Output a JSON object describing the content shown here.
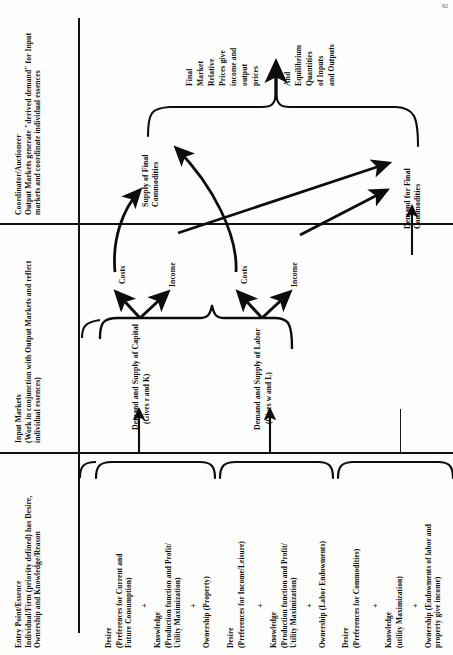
{
  "diagram": {
    "page_number": "92"
  },
  "sections": [
    {
      "id": "coordinator",
      "heading": "Coordinator/Auctioneer",
      "body": "Output Markets generate \"derived demand\" for Input markets and coordinate individual essences"
    },
    {
      "id": "input-markets",
      "heading": "Input Markets",
      "body": "(Work in conjunction with Output Markets and reflect individual essences)"
    },
    {
      "id": "entry-point",
      "heading": "Entry Point/Essence",
      "body": "Individual/Firm (priority defined) has Desire, Ownership and Knowledge/Reason"
    }
  ],
  "output_nodes": {
    "supply": "Supply of Final Commodities",
    "demand": "Demand for Final Commodities"
  },
  "outcome": {
    "line1": "Final",
    "line2": "Market",
    "line3": "Relative",
    "line4": "Prices give",
    "line5": "income and",
    "line6": "output",
    "line7": "prices",
    "line8": "And",
    "line9": "Equilibrium",
    "line10": "Quantities",
    "line11": "of Inputs",
    "line12": "and Outputs"
  },
  "input_markets": [
    {
      "name": "Demand and Supply of Capital",
      "gives": "(Gives r and K)",
      "cost_label": "Costs",
      "income_label": "Income"
    },
    {
      "name": "Demand and Supply of Labor",
      "gives": "(Gives w and L)",
      "cost_label": "Costs",
      "income_label": "Income"
    }
  ],
  "agents": [
    {
      "id": "firm-capital",
      "desire_head": "Desire",
      "desire_body": "(Preferences for Current and Future Consumption)",
      "plus1": "+",
      "knowledge_head": "Knowledge",
      "knowledge_body": "(Production function and Profit/ Utility Maximization)",
      "plus2": "+",
      "ownership": "Ownership (Property)"
    },
    {
      "id": "firm-labor",
      "desire_head": "Desire",
      "desire_body": "(Preferences for Income/Leisure)",
      "plus1": "+",
      "knowledge_head": "Knowledge",
      "knowledge_body": "(Production function and Profit/ Utility Maximization)",
      "plus2": "+",
      "ownership": "Ownership (Labor Endowments)"
    },
    {
      "id": "household",
      "desire_head": "Desire",
      "desire_body": "(Preferences for Commodities)",
      "plus1": "+",
      "knowledge_head": "Knowledge",
      "knowledge_body": "(utility Maximization)",
      "plus2": "+",
      "ownership": "Ownership (Endowments of labor and property give income)"
    }
  ],
  "colors": {
    "ink": "#0d0d0d",
    "paper": "#fdfdfb",
    "rule": "#111111"
  }
}
